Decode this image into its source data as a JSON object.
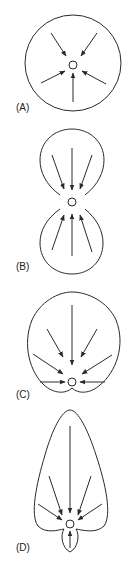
{
  "panels": [
    {
      "id": "A",
      "label": "(A)",
      "shape": "circle"
    },
    {
      "id": "B",
      "label": "(B)",
      "shape": "two-lobed (figure-eight)"
    },
    {
      "id": "C",
      "label": "(C)",
      "shape": "heart-shaped"
    },
    {
      "id": "D",
      "label": "(D)",
      "shape": "elongated leaf with small lower lobe"
    }
  ],
  "colors": {
    "stroke": "#2a2a2a",
    "background": "#ffffff"
  }
}
